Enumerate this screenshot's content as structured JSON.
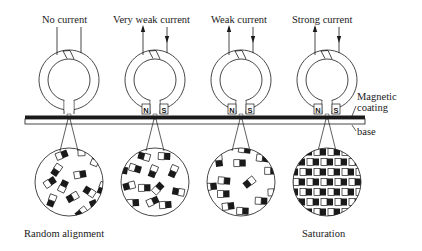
{
  "diagram": {
    "heads": [
      {
        "label": "No current",
        "cx": 69,
        "show_poles": false,
        "arrows": false
      },
      {
        "label": "Very weak current",
        "cx": 155,
        "show_poles": true,
        "arrows": true
      },
      {
        "label": "Weak current",
        "cx": 241,
        "show_poles": true,
        "arrows": true
      },
      {
        "label": "Strong current",
        "cx": 327,
        "show_poles": true,
        "arrows": true
      }
    ],
    "poles": {
      "north": "N",
      "south": "S"
    },
    "tape_labels": {
      "coating": "Magnetic\ncoating",
      "coating_line1": "Magnetic",
      "coating_line2": "coating",
      "base": "base"
    },
    "bottom_labels": {
      "left": "Random alignment",
      "right": "Saturation"
    },
    "colors": {
      "ink": "#1a1a1a",
      "background": "#ffffff"
    }
  }
}
